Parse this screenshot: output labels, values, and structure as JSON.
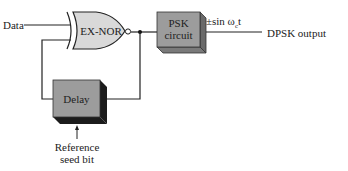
{
  "diagram": {
    "type": "block-diagram",
    "inputs": {
      "data_label": "Data",
      "reference_label_line1": "Reference",
      "reference_label_line2": "seed bit"
    },
    "blocks": {
      "gate_label": "EX-NOR",
      "psk_line1": "PSK",
      "psk_line2": "circuit",
      "delay_label": "Delay"
    },
    "signals": {
      "carrier_label": "±sin ω",
      "carrier_subscript": "c",
      "carrier_suffix": "t",
      "output_label": "DPSK output"
    },
    "colors": {
      "block_fill": "#9c9c9c",
      "block_side": "#6a6a6a",
      "delay_shadow": "#1c1c1c",
      "gate_fill": "#d9d9d9",
      "line": "#222222"
    }
  }
}
